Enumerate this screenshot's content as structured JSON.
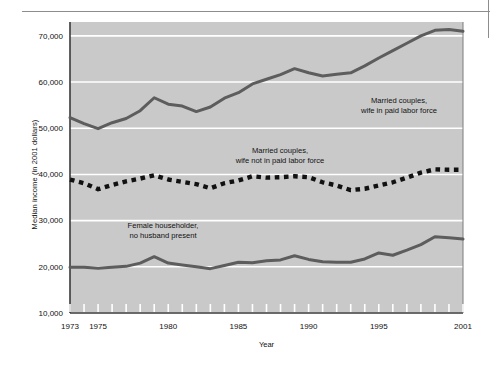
{
  "figure": {
    "plot_bg_color": "#c9c9c9",
    "gridline_color": "#ffffff",
    "axis_color": "#3a3a3a",
    "series_color": "#5d5d5d",
    "dash_color": "#111111",
    "rule_color": "#8d8d8d"
  },
  "chart_data": {
    "type": "line",
    "title": "",
    "subtitle": "",
    "xlabel": "Year",
    "ylabel": "Median income (in 2001 dollars)",
    "xlim": [
      1973,
      2001
    ],
    "ylim": [
      10000,
      73000
    ],
    "grid": true,
    "grid_axis": "y",
    "legend_position": "inline-annotations",
    "ytick_labels": [
      "10,000",
      "20,000",
      "30,000",
      "40,000",
      "50,000",
      "60,000",
      "70,000"
    ],
    "ytick_values": [
      10000,
      20000,
      30000,
      40000,
      50000,
      60000,
      70000
    ],
    "xtick_labels": [
      "1973",
      "1975",
      "1980",
      "1985",
      "1990",
      "1995",
      "2001"
    ],
    "xtick_values": [
      1973,
      1975,
      1980,
      1985,
      1990,
      1995,
      2001
    ],
    "x": [
      1973,
      1974,
      1975,
      1976,
      1977,
      1978,
      1979,
      1980,
      1981,
      1982,
      1983,
      1984,
      1985,
      1986,
      1987,
      1988,
      1989,
      1990,
      1991,
      1992,
      1993,
      1994,
      1995,
      1996,
      1997,
      1998,
      1999,
      2000,
      2001
    ],
    "series": [
      {
        "name": "Married couples, wife in paid labor force",
        "style": "solid",
        "color": "#5d5d5d",
        "values": [
          52300,
          51000,
          49900,
          51200,
          52100,
          53800,
          56600,
          55200,
          54800,
          53600,
          54600,
          56500,
          57700,
          59600,
          60600,
          61600,
          62900,
          62000,
          61300,
          61700,
          62000,
          63500,
          65200,
          66800,
          68400,
          70000,
          71200,
          71400,
          71000
        ]
      },
      {
        "name": "Married couples, wife not in paid labor force",
        "style": "dashed",
        "color": "#111111",
        "values": [
          38900,
          38100,
          36800,
          37700,
          38500,
          39100,
          39800,
          38900,
          38400,
          37900,
          37000,
          38100,
          38700,
          39600,
          39300,
          39400,
          39600,
          39400,
          38300,
          37600,
          36600,
          36900,
          37600,
          38300,
          39300,
          40400,
          41100,
          41000,
          41000
        ]
      },
      {
        "name": "Female householder, no husband present",
        "style": "solid",
        "color": "#5d5d5d",
        "values": [
          19900,
          19900,
          19700,
          19900,
          20100,
          20800,
          22200,
          20800,
          20400,
          20000,
          19600,
          20300,
          21000,
          20900,
          21300,
          21500,
          22400,
          21600,
          21100,
          21000,
          21000,
          21700,
          23000,
          22500,
          23600,
          24800,
          26500,
          26300,
          26000
        ]
      }
    ],
    "annotations": [
      {
        "id": "annotation-wife-in-labor-force",
        "lines": [
          "Married couples,",
          "wife in paid labor force"
        ],
        "x_px": 399,
        "y_px": 103
      },
      {
        "id": "annotation-wife-not-in-labor-force",
        "lines": [
          "Married couples,",
          "wife not in paid labor force"
        ],
        "x_px": 280,
        "y_px": 153
      },
      {
        "id": "annotation-female-householder",
        "lines": [
          "Female householder,",
          "no husband present"
        ],
        "x_px": 163,
        "y_px": 228
      }
    ]
  }
}
